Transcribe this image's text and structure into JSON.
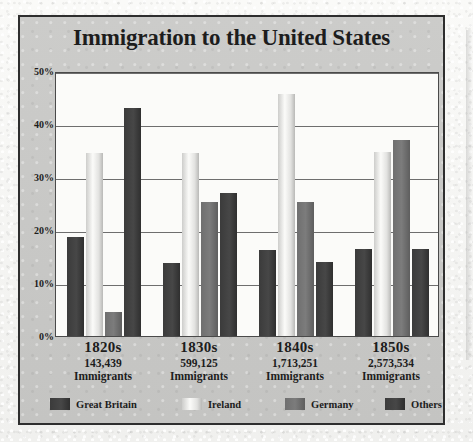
{
  "chart_data": {
    "type": "bar",
    "title": "Immigration to the United States",
    "xlabel": "",
    "ylabel": "",
    "ylim": [
      0,
      50
    ],
    "ytick_labels": [
      "50%",
      "40%",
      "30%",
      "20%",
      "10%",
      "0%"
    ],
    "ytick_values": [
      50,
      40,
      30,
      20,
      10,
      0
    ],
    "grid": true,
    "legend_position": "bottom",
    "categories": [
      "1820s",
      "1830s",
      "1840s",
      "1850s"
    ],
    "category_sublabels": [
      {
        "decade": "1820s",
        "count": "143,439",
        "word": "Immigrants"
      },
      {
        "decade": "1830s",
        "count": "599,125",
        "word": "Immigrants"
      },
      {
        "decade": "1840s",
        "count": "1,713,251",
        "word": "Immigrants"
      },
      {
        "decade": "1850s",
        "count": "2,573,534",
        "word": "Immigrants"
      }
    ],
    "series": [
      {
        "name": "Great Britain",
        "color": "#3b3b3b",
        "values": [
          18.7,
          13.7,
          16.3,
          16.5
        ]
      },
      {
        "name": "Ireland",
        "color": "#e8e8e6",
        "values": [
          34.5,
          34.6,
          45.6,
          34.8
        ]
      },
      {
        "name": "Germany",
        "color": "#6f6f6f",
        "values": [
          4.5,
          25.3,
          25.3,
          37.0
        ]
      },
      {
        "name": "Others",
        "color": "#3b3b3b",
        "values": [
          43.0,
          27.0,
          14.0,
          16.5
        ]
      }
    ]
  },
  "legend": {
    "items": [
      {
        "label": "Great Britain"
      },
      {
        "label": "Ireland"
      },
      {
        "label": "Germany"
      },
      {
        "label": "Others"
      }
    ]
  },
  "margin_marks": ""
}
